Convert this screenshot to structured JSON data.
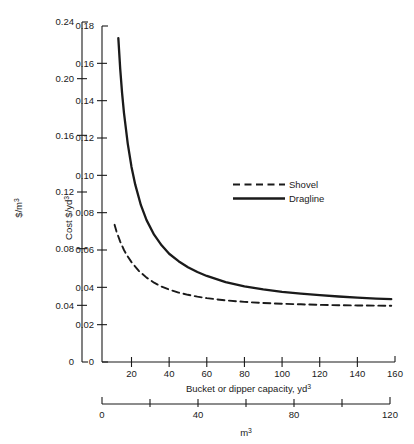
{
  "chart_data": {
    "type": "line",
    "title": "",
    "xlabel": "Bucket or dipper capacity, yd",
    "xlabel_sup": "3",
    "ylabel": "Cost $/yd",
    "ylabel_sup": "3",
    "secondary_ylabel": "$/m",
    "secondary_ylabel_sup": "3",
    "secondary_xlabel": "m",
    "secondary_xlabel_sup": "3",
    "xlim": [
      8,
      160
    ],
    "ylim": [
      0,
      0.18
    ],
    "secondary_ylim": [
      0,
      0.24
    ],
    "secondary_xlim": [
      0,
      120
    ],
    "grid": false,
    "legend_position": "upper-right-inside",
    "x_ticks": [
      20,
      40,
      60,
      80,
      100,
      120,
      140,
      160
    ],
    "x_tick_labels": [
      "20",
      "40",
      "60",
      "80",
      "100",
      "120",
      "140",
      "160"
    ],
    "y_ticks": [
      0,
      0.02,
      0.04,
      0.06,
      0.08,
      0.1,
      0.12,
      0.14,
      0.16,
      0.18
    ],
    "y_tick_labels": [
      "0",
      "0.02",
      "0.04",
      "0.06",
      "0.08",
      "0.10",
      "0.12",
      "0.14",
      "0.16",
      "0.18"
    ],
    "secondary_y_ticks": [
      0,
      0.04,
      0.08,
      0.12,
      0.16,
      0.2,
      0.24
    ],
    "secondary_y_tick_labels": [
      "0",
      "0.04",
      "0.08",
      "0.12",
      "0.16",
      "0.20",
      "0.24"
    ],
    "secondary_x_ticks": [
      0,
      20,
      40,
      60,
      80,
      100,
      120
    ],
    "secondary_x_tick_labels": [
      "0",
      "",
      "40",
      "",
      "80",
      "",
      "120"
    ],
    "series": [
      {
        "name": "Shovel",
        "style": "dashed",
        "color": "#1a1a1a",
        "x": [
          11,
          12,
          14,
          16,
          18,
          20,
          24,
          28,
          32,
          36,
          40,
          45,
          50,
          55,
          60,
          70,
          80,
          90,
          100,
          110,
          120,
          130,
          140,
          150,
          158
        ],
        "y": [
          0.0735,
          0.07,
          0.0645,
          0.06,
          0.0565,
          0.0535,
          0.0487,
          0.0452,
          0.0425,
          0.0404,
          0.0388,
          0.0372,
          0.036,
          0.035,
          0.0342,
          0.033,
          0.0322,
          0.0316,
          0.0312,
          0.0309,
          0.0306,
          0.0304,
          0.0303,
          0.0302,
          0.0301
        ]
      },
      {
        "name": "Dragline",
        "style": "solid",
        "color": "#1a1a1a",
        "x": [
          13,
          14,
          15,
          16,
          18,
          20,
          22,
          25,
          28,
          32,
          36,
          40,
          45,
          50,
          55,
          60,
          70,
          80,
          90,
          100,
          110,
          120,
          130,
          140,
          150,
          158
        ],
        "y": [
          0.1735,
          0.157,
          0.144,
          0.1335,
          0.117,
          0.1045,
          0.095,
          0.084,
          0.076,
          0.0682,
          0.0625,
          0.058,
          0.054,
          0.0508,
          0.0482,
          0.0461,
          0.0428,
          0.0405,
          0.0389,
          0.0376,
          0.0366,
          0.0358,
          0.0351,
          0.0345,
          0.034,
          0.0337
        ]
      }
    ]
  },
  "legend": {
    "items": [
      {
        "label": "Shovel",
        "style": "dashed"
      },
      {
        "label": "Dragline",
        "style": "solid"
      }
    ]
  }
}
